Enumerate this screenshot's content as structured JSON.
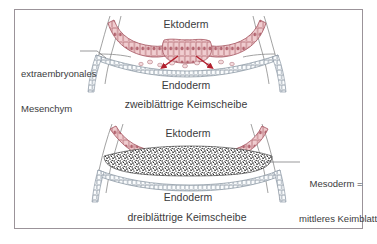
{
  "figure": {
    "frame_color": "#9b9399",
    "background_color": "#ffffff",
    "text_color": "#3b3b3d",
    "ectoderm_color": "#e9b9bc",
    "ectoderm_outline": "#b4636d",
    "endoderm_outline": "#8d9aa6",
    "mesoderm_color": "#1a1a1a",
    "arrow_color": "#b21f2d",
    "membrane_color": "#8a8a8a"
  },
  "top_panel": {
    "ectoderm_label": "Ektoderm",
    "endoderm_label": "Endoderm",
    "caption": "zweiblättrige Keimscheibe",
    "arrow_count": 2
  },
  "bottom_panel": {
    "ectoderm_label": "Ektoderm",
    "endoderm_label": "Endoderm",
    "caption": "dreiblättrige Keimscheibe"
  },
  "annotations": {
    "left": {
      "line1": "extraembryonales",
      "line2": "Mesenchym"
    },
    "right": {
      "line1": "Mesoderm =",
      "line2": "mittleres Keimblatt"
    }
  }
}
